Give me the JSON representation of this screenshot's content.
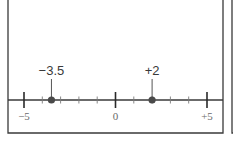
{
  "diagram": {
    "type": "number-line",
    "range": [
      -5,
      5
    ],
    "minor_tick_step": 1,
    "major_ticks": [
      -5,
      0,
      5
    ],
    "tick_labels": [
      {
        "value": -5,
        "text": "−5"
      },
      {
        "value": 0,
        "text": "0"
      },
      {
        "value": 5,
        "text": "+5"
      }
    ],
    "points": [
      {
        "value": -3.5,
        "label": "−3.5"
      },
      {
        "value": 2,
        "label": "+2"
      }
    ],
    "colors": {
      "line": "#3a3a3a",
      "point": "#4a4a4a",
      "tick_label": "#6a6a6a"
    }
  }
}
